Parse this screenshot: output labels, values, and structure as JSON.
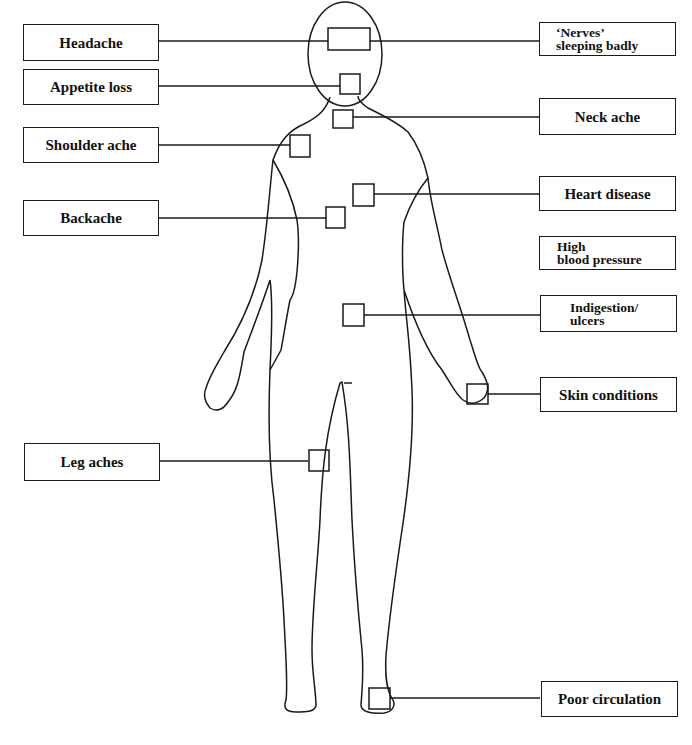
{
  "diagram": {
    "type": "body-symptom-map",
    "left_labels": [
      {
        "id": "headache",
        "text": "Headache"
      },
      {
        "id": "appetite-loss",
        "text": "Appetite loss"
      },
      {
        "id": "shoulder-ache",
        "text": "Shoulder ache"
      },
      {
        "id": "backache",
        "text": "Backache"
      },
      {
        "id": "leg-aches",
        "text": "Leg aches"
      }
    ],
    "right_labels": [
      {
        "id": "nerves",
        "line1": "‘Nerves’",
        "line2": "sleeping badly"
      },
      {
        "id": "neck-ache",
        "text": "Neck ache"
      },
      {
        "id": "heart-disease",
        "text": "Heart disease"
      },
      {
        "id": "high-blood-pressure",
        "line1": "High",
        "line2": "blood pressure"
      },
      {
        "id": "indigestion",
        "line1": "Indigestion/",
        "line2": "ulcers"
      },
      {
        "id": "skin-conditions",
        "text": "Skin conditions"
      },
      {
        "id": "poor-circulation",
        "text": "Poor circulation"
      }
    ],
    "colors": {
      "line": "#1a1a1a",
      "background": "#ffffff"
    }
  }
}
